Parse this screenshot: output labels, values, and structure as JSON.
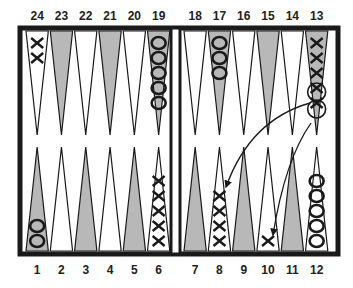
{
  "colors": {
    "frame": "#1a1a1a",
    "dark_point": "#b8b8b8",
    "light_point": "#ffffff",
    "checker": "#1a1a1a"
  },
  "top_labels": [
    "24",
    "23",
    "22",
    "21",
    "20",
    "19",
    "18",
    "17",
    "16",
    "15",
    "14",
    "13"
  ],
  "bottom_labels": [
    "1",
    "2",
    "3",
    "4",
    "5",
    "6",
    "7",
    "8",
    "9",
    "10",
    "11",
    "12"
  ],
  "checkers": [
    {
      "point": 24,
      "player": "X",
      "count": 2
    },
    {
      "point": 19,
      "player": "O",
      "count": 5
    },
    {
      "point": 17,
      "player": "O",
      "count": 3
    },
    {
      "point": 13,
      "player": "X",
      "count": 5,
      "note": "two highlighted (circled) checkers moving"
    },
    {
      "point": 1,
      "player": "O",
      "count": 2
    },
    {
      "point": 6,
      "player": "X",
      "count": 5
    },
    {
      "point": 8,
      "player": "X",
      "count": 4
    },
    {
      "point": 10,
      "player": "X",
      "count": 1
    },
    {
      "point": 12,
      "player": "O",
      "count": 5
    }
  ],
  "moves": [
    {
      "from": 13,
      "to": 8
    },
    {
      "from": 13,
      "to": 10
    }
  ]
}
